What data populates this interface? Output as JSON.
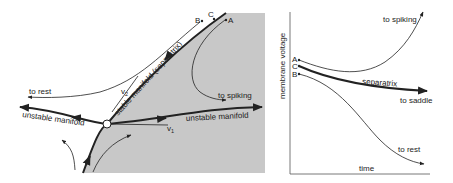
{
  "phase_portrait": {
    "region_color": "#c8c8c8",
    "points": {
      "A": "A",
      "B": "B",
      "C": "C"
    },
    "labels": {
      "to_rest": "to rest",
      "to_spiking": "to spiking",
      "v1": "v",
      "v1_sub": "1",
      "v2": "v",
      "v2_sub": "2",
      "stable_manifold": "stable manifold (separatrix)",
      "unstable_manifold_left": "unstable manifold",
      "unstable_manifold_right": "unstable manifold"
    }
  },
  "time_plot": {
    "xlabel": "time",
    "ylabel": "membrane voltage",
    "points": {
      "A": "A",
      "B": "B",
      "C": "C"
    },
    "labels": {
      "to_spiking": "to spiking",
      "separatrix": "separatrix",
      "to_saddle": "to saddle",
      "to_rest": "to rest"
    }
  }
}
